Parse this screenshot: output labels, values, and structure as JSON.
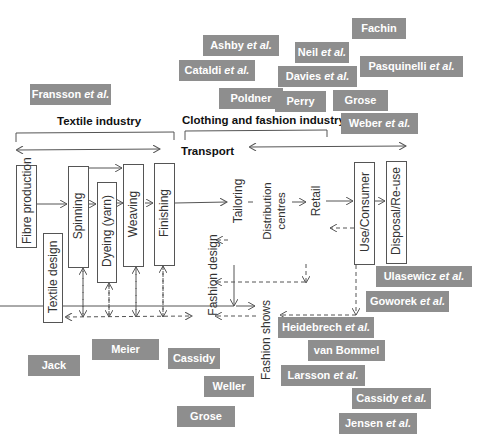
{
  "headers": {
    "textile": "Textile industry",
    "clothing": "Clothing and fashion industry",
    "transport": "Transport"
  },
  "stages": {
    "fibre": "Fibre production",
    "textile_design": "Textile design",
    "spinning": "Spinning",
    "dyeing": "Dyeing (yarn)",
    "weaving": "Weaving",
    "finishing": "Finishing",
    "fashion_design": "Fashion design",
    "tailoring": "Tailoring",
    "distribution": "Distribution centres",
    "retail": "Retail",
    "use": "Use/Consumer",
    "disposal": "Disposal/Re-use",
    "fashion_shows": "Fashion shows"
  },
  "tags": [
    {
      "name": "Ashby",
      "etal": true
    },
    {
      "name": "Cataldi",
      "etal": true
    },
    {
      "name": "Poldner",
      "etal": false
    },
    {
      "name": "Neil",
      "etal": true
    },
    {
      "name": "Davies",
      "etal": true
    },
    {
      "name": "Perry",
      "etal": false
    },
    {
      "name": "Fachin",
      "etal": false
    },
    {
      "name": "Pasquinelli",
      "etal": true
    },
    {
      "name": "Grose",
      "etal": false
    },
    {
      "name": "Weber",
      "etal": true
    },
    {
      "name": "Fransson",
      "etal": true
    },
    {
      "name": "Jack",
      "etal": false
    },
    {
      "name": "Meier",
      "etal": false
    },
    {
      "name": "Cassidy",
      "etal": false
    },
    {
      "name": "Weller",
      "etal": false
    },
    {
      "name": "Grose",
      "etal": false
    },
    {
      "name": "Ulasewicz",
      "etal": true
    },
    {
      "name": "Goworek",
      "etal": true
    },
    {
      "name": "Heidebrech",
      "etal": true
    },
    {
      "name": "van Bommel",
      "etal": false
    },
    {
      "name": "Larsson",
      "etal": true
    },
    {
      "name": "Cassidy",
      "etal": true
    },
    {
      "name": "Jensen",
      "etal": true
    }
  ],
  "etal_text": " et al.",
  "colors": {
    "tag_bg": "#8e8e8e",
    "tag_text": "#ffffff",
    "line": "#555555"
  }
}
